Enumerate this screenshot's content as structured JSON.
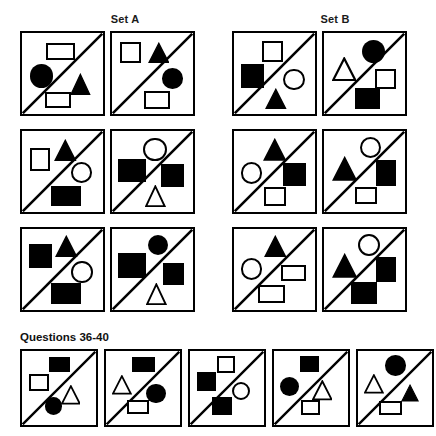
{
  "header": {
    "set_a_label": "Set A",
    "set_b_label": "Set B"
  },
  "questions_section": {
    "label": "Questions 36-40"
  },
  "colors": {
    "ink": "#000000",
    "background": "#ffffff",
    "label_text": "#1a1a1a"
  },
  "legend": {
    "shape_kinds": [
      "square",
      "rectangle",
      "circle",
      "triangle"
    ],
    "fills": [
      "filled",
      "outline"
    ],
    "divider": "diagonal-line-bottom-left-to-top-right"
  },
  "sets": [
    {
      "name": "Set A",
      "rows": [
        {
          "cells": [
            {
              "id": "a-r1-c1",
              "shapes": [
                {
                  "kind": "rectangle",
                  "fill": "outline",
                  "x": 26,
                  "y": 11,
                  "w": 30,
                  "h": 18
                },
                {
                  "kind": "circle",
                  "fill": "filled",
                  "x": 8,
                  "y": 33,
                  "w": 25,
                  "h": 25
                },
                {
                  "kind": "triangle",
                  "fill": "filled",
                  "x": 51,
                  "y": 42,
                  "w": 22,
                  "h": 24
                },
                {
                  "kind": "rectangle",
                  "fill": "outline",
                  "x": 24,
                  "y": 63,
                  "w": 28,
                  "h": 17
                }
              ]
            },
            {
              "id": "a-r1-c2",
              "shapes": [
                {
                  "kind": "square",
                  "fill": "outline",
                  "x": 9,
                  "y": 10,
                  "w": 22,
                  "h": 22
                },
                {
                  "kind": "triangle",
                  "fill": "filled",
                  "x": 38,
                  "y": 10,
                  "w": 23,
                  "h": 23
                },
                {
                  "kind": "circle",
                  "fill": "filled",
                  "x": 53,
                  "y": 37,
                  "w": 22,
                  "h": 22
                },
                {
                  "kind": "square",
                  "fill": "outline",
                  "x": 34,
                  "y": 62,
                  "w": 28,
                  "h": 19
                }
              ]
            }
          ]
        },
        {
          "cells": [
            {
              "id": "a-r2-c1",
              "shapes": [
                {
                  "kind": "square",
                  "fill": "outline",
                  "x": 8,
                  "y": 18,
                  "w": 22,
                  "h": 25
                },
                {
                  "kind": "triangle",
                  "fill": "filled",
                  "x": 34,
                  "y": 8,
                  "w": 24,
                  "h": 24
                },
                {
                  "kind": "circle",
                  "fill": "outline",
                  "x": 52,
                  "y": 33,
                  "w": 22,
                  "h": 22
                },
                {
                  "kind": "rectangle",
                  "fill": "filled",
                  "x": 31,
                  "y": 58,
                  "w": 32,
                  "h": 22
                }
              ]
            },
            {
              "id": "a-r2-c2",
              "shapes": [
                {
                  "kind": "circle",
                  "fill": "outline",
                  "x": 33,
                  "y": 7,
                  "w": 25,
                  "h": 25
                },
                {
                  "kind": "rectangle",
                  "fill": "filled",
                  "x": 6,
                  "y": 30,
                  "w": 30,
                  "h": 24
                },
                {
                  "kind": "square",
                  "fill": "filled",
                  "x": 52,
                  "y": 35,
                  "w": 24,
                  "h": 24
                },
                {
                  "kind": "triangle",
                  "fill": "outline",
                  "x": 35,
                  "y": 57,
                  "w": 22,
                  "h": 24
                }
              ]
            }
          ]
        },
        {
          "cells": [
            {
              "id": "a-r3-c1",
              "shapes": [
                {
                  "kind": "rectangle",
                  "fill": "filled",
                  "x": 7,
                  "y": 16,
                  "w": 25,
                  "h": 25
                },
                {
                  "kind": "triangle",
                  "fill": "filled",
                  "x": 35,
                  "y": 6,
                  "w": 24,
                  "h": 24
                },
                {
                  "kind": "circle",
                  "fill": "outline",
                  "x": 52,
                  "y": 34,
                  "w": 23,
                  "h": 23
                },
                {
                  "kind": "rectangle",
                  "fill": "filled",
                  "x": 31,
                  "y": 57,
                  "w": 32,
                  "h": 23
                }
              ]
            },
            {
              "id": "a-r3-c2",
              "shapes": [
                {
                  "kind": "circle",
                  "fill": "filled",
                  "x": 38,
                  "y": 6,
                  "w": 22,
                  "h": 22
                },
                {
                  "kind": "rectangle",
                  "fill": "filled",
                  "x": 6,
                  "y": 26,
                  "w": 30,
                  "h": 26
                },
                {
                  "kind": "square",
                  "fill": "filled",
                  "x": 54,
                  "y": 36,
                  "w": 22,
                  "h": 24
                },
                {
                  "kind": "triangle",
                  "fill": "outline",
                  "x": 36,
                  "y": 57,
                  "w": 22,
                  "h": 24
                }
              ]
            }
          ]
        }
      ]
    },
    {
      "name": "Set B",
      "rows": [
        {
          "cells": [
            {
              "id": "b-r1-c1",
              "shapes": [
                {
                  "kind": "square",
                  "fill": "outline",
                  "x": 30,
                  "y": 9,
                  "w": 22,
                  "h": 22
                },
                {
                  "kind": "square",
                  "fill": "filled",
                  "x": 7,
                  "y": 33,
                  "w": 25,
                  "h": 25
                },
                {
                  "kind": "circle",
                  "fill": "outline",
                  "x": 52,
                  "y": 38,
                  "w": 23,
                  "h": 23
                },
                {
                  "kind": "triangle",
                  "fill": "filled",
                  "x": 33,
                  "y": 58,
                  "w": 23,
                  "h": 23
                }
              ]
            },
            {
              "id": "b-r1-c2",
              "shapes": [
                {
                  "kind": "circle",
                  "fill": "filled",
                  "x": 40,
                  "y": 7,
                  "w": 25,
                  "h": 25
                },
                {
                  "kind": "triangle",
                  "fill": "outline",
                  "x": 8,
                  "y": 26,
                  "w": 26,
                  "h": 26
                },
                {
                  "kind": "square",
                  "fill": "outline",
                  "x": 54,
                  "y": 38,
                  "w": 22,
                  "h": 22
                },
                {
                  "kind": "square",
                  "fill": "filled",
                  "x": 33,
                  "y": 58,
                  "w": 27,
                  "h": 23
                }
              ]
            }
          ]
        },
        {
          "cells": [
            {
              "id": "b-r2-c1",
              "shapes": [
                {
                  "kind": "triangle",
                  "fill": "filled",
                  "x": 31,
                  "y": 7,
                  "w": 25,
                  "h": 25
                },
                {
                  "kind": "circle",
                  "fill": "outline",
                  "x": 7,
                  "y": 33,
                  "w": 23,
                  "h": 23
                },
                {
                  "kind": "square",
                  "fill": "filled",
                  "x": 52,
                  "y": 34,
                  "w": 24,
                  "h": 24
                },
                {
                  "kind": "square",
                  "fill": "outline",
                  "x": 32,
                  "y": 60,
                  "w": 23,
                  "h": 20
                }
              ]
            },
            {
              "id": "b-r2-c2",
              "shapes": [
                {
                  "kind": "circle",
                  "fill": "outline",
                  "x": 38,
                  "y": 6,
                  "w": 23,
                  "h": 23
                },
                {
                  "kind": "triangle",
                  "fill": "filled",
                  "x": 8,
                  "y": 27,
                  "w": 27,
                  "h": 27
                },
                {
                  "kind": "square",
                  "fill": "filled",
                  "x": 55,
                  "y": 31,
                  "w": 21,
                  "h": 27
                },
                {
                  "kind": "square",
                  "fill": "outline",
                  "x": 33,
                  "y": 60,
                  "w": 23,
                  "h": 18
                }
              ]
            }
          ]
        },
        {
          "cells": [
            {
              "id": "b-r3-c1",
              "shapes": [
                {
                  "kind": "triangle",
                  "fill": "filled",
                  "x": 32,
                  "y": 6,
                  "w": 24,
                  "h": 24
                },
                {
                  "kind": "circle",
                  "fill": "outline",
                  "x": 7,
                  "y": 31,
                  "w": 23,
                  "h": 23
                },
                {
                  "kind": "rectangle",
                  "fill": "outline",
                  "x": 50,
                  "y": 38,
                  "w": 26,
                  "h": 17
                },
                {
                  "kind": "rectangle",
                  "fill": "outline",
                  "x": 26,
                  "y": 60,
                  "w": 28,
                  "h": 19
                }
              ]
            },
            {
              "id": "b-r3-c2",
              "shapes": [
                {
                  "kind": "circle",
                  "fill": "outline",
                  "x": 36,
                  "y": 5,
                  "w": 24,
                  "h": 24
                },
                {
                  "kind": "triangle",
                  "fill": "filled",
                  "x": 8,
                  "y": 26,
                  "w": 27,
                  "h": 27
                },
                {
                  "kind": "square",
                  "fill": "filled",
                  "x": 55,
                  "y": 30,
                  "w": 22,
                  "h": 26
                },
                {
                  "kind": "square",
                  "fill": "filled",
                  "x": 29,
                  "y": 56,
                  "w": 27,
                  "h": 24
                }
              ]
            }
          ]
        }
      ]
    }
  ],
  "answer_row": {
    "cells": [
      {
        "id": "q-opt-1",
        "shapes": [
          {
            "kind": "rectangle",
            "fill": "filled",
            "x": 32,
            "y": 7,
            "w": 24,
            "h": 17
          },
          {
            "kind": "square",
            "fill": "outline",
            "x": 8,
            "y": 27,
            "w": 24,
            "h": 19
          },
          {
            "kind": "triangle",
            "fill": "outline",
            "x": 45,
            "y": 40,
            "w": 23,
            "h": 23
          },
          {
            "kind": "circle",
            "fill": "filled",
            "x": 27,
            "y": 54,
            "w": 20,
            "h": 20
          }
        ]
      },
      {
        "id": "q-opt-2",
        "shapes": [
          {
            "kind": "rectangle",
            "fill": "filled",
            "x": 30,
            "y": 7,
            "w": 27,
            "h": 17
          },
          {
            "kind": "triangle",
            "fill": "outline",
            "x": 7,
            "y": 28,
            "w": 23,
            "h": 23
          },
          {
            "kind": "circle",
            "fill": "filled",
            "x": 47,
            "y": 38,
            "w": 23,
            "h": 23
          },
          {
            "kind": "rectangle",
            "fill": "outline",
            "x": 24,
            "y": 57,
            "w": 26,
            "h": 16
          }
        ]
      },
      {
        "id": "q-opt-3",
        "shapes": [
          {
            "kind": "square",
            "fill": "outline",
            "x": 32,
            "y": 6,
            "w": 20,
            "h": 20
          },
          {
            "kind": "square",
            "fill": "filled",
            "x": 8,
            "y": 25,
            "w": 22,
            "h": 22
          },
          {
            "kind": "circle",
            "fill": "outline",
            "x": 49,
            "y": 36,
            "w": 21,
            "h": 21
          },
          {
            "kind": "square",
            "fill": "filled",
            "x": 26,
            "y": 54,
            "w": 23,
            "h": 20
          }
        ]
      },
      {
        "id": "q-opt-4",
        "shapes": [
          {
            "kind": "square",
            "fill": "filled",
            "x": 30,
            "y": 6,
            "w": 22,
            "h": 19
          },
          {
            "kind": "circle",
            "fill": "filled",
            "x": 7,
            "y": 30,
            "w": 22,
            "h": 22
          },
          {
            "kind": "triangle",
            "fill": "outline",
            "x": 44,
            "y": 34,
            "w": 24,
            "h": 24
          },
          {
            "kind": "square",
            "fill": "outline",
            "x": 31,
            "y": 57,
            "w": 22,
            "h": 18
          }
        ]
      },
      {
        "id": "q-opt-5",
        "shapes": [
          {
            "kind": "circle",
            "fill": "filled",
            "x": 32,
            "y": 5,
            "w": 24,
            "h": 24
          },
          {
            "kind": "triangle",
            "fill": "outline",
            "x": 7,
            "y": 27,
            "w": 23,
            "h": 23
          },
          {
            "kind": "triangle",
            "fill": "filled",
            "x": 50,
            "y": 39,
            "w": 21,
            "h": 21
          },
          {
            "kind": "rectangle",
            "fill": "outline",
            "x": 25,
            "y": 58,
            "w": 26,
            "h": 17
          }
        ]
      }
    ]
  },
  "layout": {
    "panel_size": 85,
    "answer_panel_size": 78,
    "set_a_cols_x": [
      20,
      110
    ],
    "set_b_cols_x": [
      232,
      322
    ],
    "rows_y": [
      31,
      129,
      227
    ],
    "answer_row_y": 349,
    "answer_cols_x": [
      20,
      104,
      188,
      272,
      356
    ]
  }
}
